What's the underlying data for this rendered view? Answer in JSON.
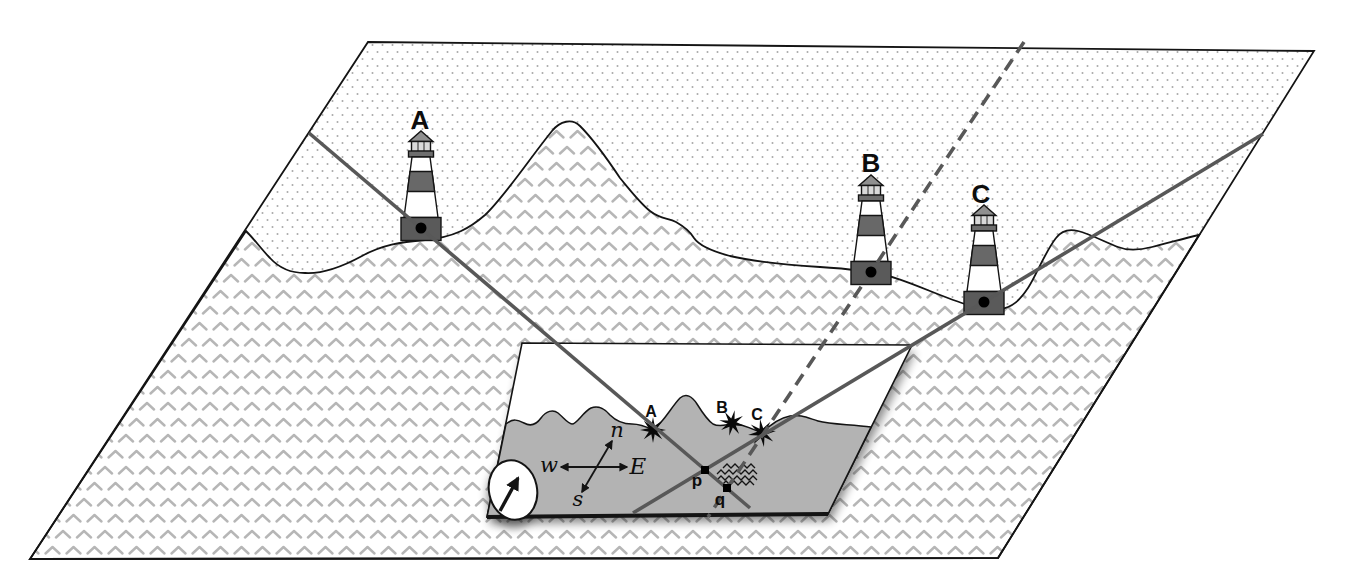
{
  "map": {
    "description_role": "perspective-view-of-coast-with-lighthouses",
    "lighthouses": [
      {
        "id": "A",
        "label": "A"
      },
      {
        "id": "B",
        "label": "B"
      },
      {
        "id": "C",
        "label": "C"
      }
    ]
  },
  "chart": {
    "description_role": "inset-nautical-chart-with-plotted-bearings",
    "lighthouse_marks": [
      {
        "id": "A",
        "label": "A"
      },
      {
        "id": "B",
        "label": "B"
      },
      {
        "id": "C",
        "label": "C"
      }
    ],
    "fix_points": [
      {
        "id": "p",
        "label": "p"
      },
      {
        "id": "q",
        "label": "q"
      }
    ],
    "compass_rose": {
      "north": "n",
      "south": "s",
      "east": "E",
      "west": "w"
    },
    "icons": {
      "compass_needle": "north-east-arrow",
      "water_symbol": "triple-wavy-lines",
      "lighthouse_mark": "star-burst"
    }
  },
  "colors": {
    "bearing_line": "#585858",
    "chart_sea": "#b3b3b3",
    "land_stipple": "#a8a8a8",
    "sea_chevron": "#b6b6b6",
    "outline": "#141414",
    "lighthouse_dark": "#686868",
    "lighthouse_base": "#5a5a5a",
    "lantern": "#d9d9d9",
    "roof": "#909090"
  }
}
